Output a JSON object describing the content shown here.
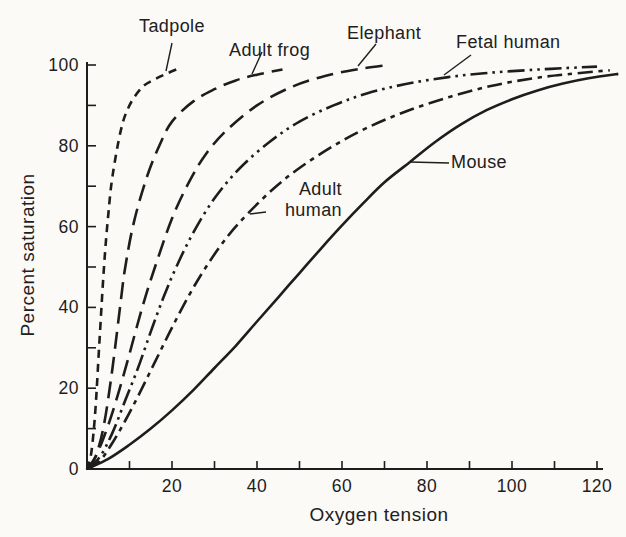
{
  "figure": {
    "background": "#fbfaf7",
    "ink": "#1d1d1b"
  },
  "chart_data": {
    "type": "line",
    "title": "",
    "xlabel": "Oxygen tension",
    "ylabel": "Percent saturation",
    "xlim": [
      0,
      127
    ],
    "ylim": [
      0,
      100
    ],
    "grid": false,
    "legend": "inline-labels-with-pointer-lines",
    "x_ticks_labeled": [
      20,
      40,
      60,
      80,
      100,
      120
    ],
    "x_ticks_minor": [
      10,
      30,
      50,
      70,
      90,
      110
    ],
    "y_ticks_labeled": [
      0,
      20,
      40,
      60,
      80,
      100
    ],
    "y_ticks_minor": [
      10,
      30,
      50,
      70,
      90
    ],
    "series": [
      {
        "name": "Tadpole",
        "line_style": "short-dash",
        "p50_approx": 4,
        "points": [
          [
            0,
            0
          ],
          [
            1,
            4
          ],
          [
            2,
            15
          ],
          [
            3,
            33
          ],
          [
            4,
            50
          ],
          [
            5,
            63
          ],
          [
            6,
            72.5
          ],
          [
            8,
            84
          ],
          [
            10,
            90
          ],
          [
            13,
            94.5
          ],
          [
            16,
            96.5
          ],
          [
            19,
            98
          ],
          [
            22,
            99.3
          ]
        ],
        "label": {
          "text": "Tadpole",
          "x": 139,
          "y": 16,
          "align": "left"
        },
        "pointer": [
          172,
          43,
          166,
          71
        ]
      },
      {
        "name": "Adult frog",
        "line_style": "long-dash",
        "p50_approx": 9,
        "points": [
          [
            0,
            0
          ],
          [
            2,
            3
          ],
          [
            4,
            11
          ],
          [
            6,
            25
          ],
          [
            8,
            42
          ],
          [
            9,
            50
          ],
          [
            11,
            61
          ],
          [
            14,
            72
          ],
          [
            17,
            80
          ],
          [
            20,
            86
          ],
          [
            25,
            91
          ],
          [
            30,
            94
          ],
          [
            35,
            96.2
          ],
          [
            40,
            97.6
          ],
          [
            46,
            98.9
          ]
        ],
        "label": {
          "text": "Adult frog",
          "x": 229,
          "y": 40,
          "align": "left"
        },
        "pointer": [
          262,
          52,
          252,
          74
        ]
      },
      {
        "name": "Elephant",
        "line_style": "long-dash",
        "p50_approx": 16,
        "points": [
          [
            0,
            0
          ],
          [
            2,
            3
          ],
          [
            4,
            8
          ],
          [
            6,
            14
          ],
          [
            8,
            21
          ],
          [
            10,
            28.5
          ],
          [
            13,
            40
          ],
          [
            16,
            50
          ],
          [
            20,
            62
          ],
          [
            24,
            71
          ],
          [
            28,
            78
          ],
          [
            33,
            84
          ],
          [
            40,
            90
          ],
          [
            48,
            94.5
          ],
          [
            56,
            97.3
          ],
          [
            64,
            99
          ],
          [
            71,
            100
          ]
        ],
        "label": {
          "text": "Elephant",
          "x": 347,
          "y": 23,
          "align": "left"
        },
        "pointer": [
          376,
          44,
          358,
          66
        ]
      },
      {
        "name": "Fetal human",
        "line_style": "dash-dot-dot",
        "p50_approx": 21,
        "points": [
          [
            0,
            0
          ],
          [
            3,
            3
          ],
          [
            6,
            9
          ],
          [
            9,
            17
          ],
          [
            12,
            25
          ],
          [
            15,
            34
          ],
          [
            18,
            42.5
          ],
          [
            21,
            50
          ],
          [
            25,
            58.5
          ],
          [
            30,
            67
          ],
          [
            36,
            74.5
          ],
          [
            43,
            81
          ],
          [
            50,
            86
          ],
          [
            58,
            90
          ],
          [
            66,
            93
          ],
          [
            75,
            95.3
          ],
          [
            85,
            97
          ],
          [
            95,
            98.1
          ],
          [
            105,
            98.8
          ],
          [
            112,
            99.2
          ],
          [
            120,
            99.6
          ]
        ],
        "label": {
          "text": "Fetal human",
          "x": 456,
          "y": 32,
          "align": "left"
        },
        "pointer": [
          471,
          55,
          444,
          75
        ]
      },
      {
        "name": "Adult human",
        "line_style": "dash-dot",
        "p50_approx": 28,
        "points": [
          [
            0,
            0
          ],
          [
            3,
            2
          ],
          [
            6,
            6.5
          ],
          [
            9,
            12
          ],
          [
            12,
            18
          ],
          [
            16,
            26.5
          ],
          [
            20,
            35
          ],
          [
            24,
            43
          ],
          [
            28,
            50
          ],
          [
            33,
            57.5
          ],
          [
            38,
            63.4
          ],
          [
            44,
            69.5
          ],
          [
            50,
            74.5
          ],
          [
            58,
            80
          ],
          [
            66,
            84.5
          ],
          [
            75,
            88.5
          ],
          [
            85,
            92
          ],
          [
            95,
            94.8
          ],
          [
            105,
            96.7
          ],
          [
            113,
            97.7
          ],
          [
            123,
            98.7
          ]
        ],
        "label": {
          "text": "Adult\nhuman",
          "x": 268,
          "y": 179,
          "align": "right",
          "w": 74
        },
        "pointer": [
          266,
          212,
          250,
          214
        ]
      },
      {
        "name": "Mouse",
        "line_style": "solid",
        "p50_approx": 51,
        "points": [
          [
            0,
            0
          ],
          [
            5,
            2.5
          ],
          [
            10,
            6
          ],
          [
            15,
            10
          ],
          [
            20,
            14.5
          ],
          [
            25,
            19.5
          ],
          [
            30,
            25
          ],
          [
            35,
            30.5
          ],
          [
            40,
            36.5
          ],
          [
            45,
            42.5
          ],
          [
            50,
            48.5
          ],
          [
            55,
            54.5
          ],
          [
            60,
            60.3
          ],
          [
            65,
            65.8
          ],
          [
            70,
            71
          ],
          [
            76,
            76
          ],
          [
            82,
            81
          ],
          [
            88,
            85.3
          ],
          [
            94,
            88.8
          ],
          [
            100,
            91.5
          ],
          [
            106,
            93.7
          ],
          [
            112,
            95.4
          ],
          [
            118,
            96.7
          ],
          [
            125,
            97.8
          ]
        ],
        "label": {
          "text": "Mouse",
          "x": 451,
          "y": 152,
          "align": "left"
        },
        "pointer": [
          449,
          163,
          410,
          162
        ]
      }
    ]
  }
}
